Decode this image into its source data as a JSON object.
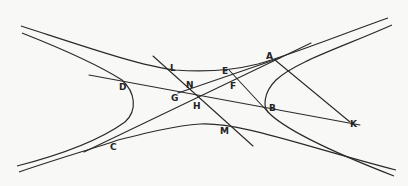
{
  "diagram": {
    "title": "",
    "points": [
      {
        "id": "A",
        "label": "A"
      },
      {
        "id": "B",
        "label": "B"
      },
      {
        "id": "C",
        "label": "C"
      },
      {
        "id": "D",
        "label": "D"
      },
      {
        "id": "E",
        "label": "E"
      },
      {
        "id": "F",
        "label": "F"
      },
      {
        "id": "G",
        "label": "G"
      },
      {
        "id": "H",
        "label": "H"
      },
      {
        "id": "K",
        "label": "K"
      },
      {
        "id": "L",
        "label": "L"
      },
      {
        "id": "M",
        "label": "M"
      },
      {
        "id": "N",
        "label": "N"
      }
    ],
    "line_color": "#2a2a2a",
    "background_color": "#f8f8f6"
  }
}
